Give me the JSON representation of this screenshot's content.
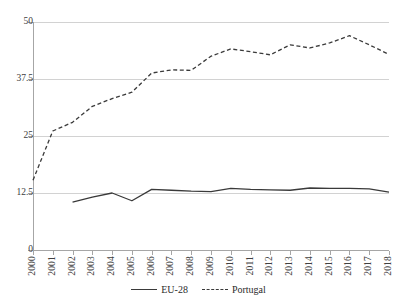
{
  "title_sliver": "·  ··  ·",
  "legend": {
    "position": "bottom-center",
    "items": [
      {
        "label": "EU-28",
        "style": "solid",
        "color": "#3a3a3a"
      },
      {
        "label": "Portugal",
        "style": "dashed",
        "color": "#3a3a3a"
      }
    ]
  },
  "axis": {
    "y_ticks": [
      "0",
      "12.5",
      "25",
      "37.5",
      "50"
    ],
    "x_ticks": [
      "2000",
      "2001",
      "2002",
      "2003",
      "2004",
      "2005",
      "2006",
      "2007",
      "2008",
      "2009",
      "2010",
      "2011",
      "2012",
      "2013",
      "2014",
      "2015",
      "2016",
      "2017",
      "2018"
    ]
  },
  "chart_data": {
    "type": "line",
    "title": "",
    "subtitle": "",
    "xlabel": "",
    "ylabel": "",
    "xlim": [
      2000,
      2018
    ],
    "ylim": [
      0,
      50
    ],
    "yticks": [
      0,
      12.5,
      25,
      37.5,
      50
    ],
    "grid": "horizontal",
    "legend_position": "bottom-center",
    "x": [
      2000,
      2001,
      2002,
      2003,
      2004,
      2005,
      2006,
      2007,
      2008,
      2009,
      2010,
      2011,
      2012,
      2013,
      2014,
      2015,
      2016,
      2017,
      2018
    ],
    "series": [
      {
        "name": "EU-28",
        "style": "solid",
        "color": "#3a3a3a",
        "values": [
          null,
          null,
          10.5,
          11.6,
          12.5,
          10.8,
          13.3,
          13.1,
          12.9,
          12.8,
          13.5,
          13.3,
          13.2,
          13.1,
          13.6,
          13.5,
          13.5,
          13.4,
          12.7
        ]
      },
      {
        "name": "Portugal",
        "style": "dashed",
        "color": "#3a3a3a",
        "values": [
          15.3,
          26.1,
          28.0,
          31.5,
          33.2,
          34.6,
          38.8,
          39.5,
          39.4,
          42.5,
          44.1,
          43.5,
          42.8,
          45.0,
          44.3,
          45.4,
          47.0,
          45.0,
          42.9
        ]
      }
    ]
  }
}
